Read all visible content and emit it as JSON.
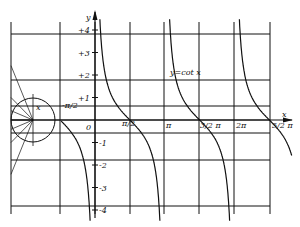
{
  "chart_data": {
    "type": "line",
    "title": "y=cot x",
    "xlabel": "x",
    "ylabel": "y",
    "function": "cot(x)",
    "x_ticks": [
      {
        "label": "-π/2",
        "value": -1.5708
      },
      {
        "label": "0",
        "value": 0
      },
      {
        "label": "π/2",
        "value": 1.5708
      },
      {
        "label": "π",
        "value": 3.1416
      },
      {
        "label": "3/2 π",
        "value": 4.7124
      },
      {
        "label": "2π",
        "value": 6.2832
      },
      {
        "label": "5/2 π",
        "value": 7.854
      }
    ],
    "y_ticks": [
      {
        "label": "+4",
        "value": 4
      },
      {
        "label": "+3",
        "value": 3
      },
      {
        "label": "+2",
        "value": 2
      },
      {
        "label": "+1",
        "value": 1
      },
      {
        "label": "-1",
        "value": -1
      },
      {
        "label": "-2",
        "value": -2
      },
      {
        "label": "-3",
        "value": -3
      },
      {
        "label": "-4",
        "value": -4
      }
    ],
    "ylim": [
      -4,
      4
    ],
    "xlim": [
      -2.6,
      8.2
    ],
    "asymptotes": [
      "-π",
      "0",
      "π",
      "2π"
    ],
    "zeros": [
      "-π/2",
      "π/2",
      "3/2 π",
      "5/2 π"
    ],
    "grid": true,
    "annotations": [
      "unit circle construction at left",
      "x (angle mark on circle)"
    ]
  },
  "layout": {
    "origin_px": [
      95,
      120
    ],
    "px_per_x_unit": 22.2,
    "px_per_y_unit": 22.5,
    "grid_v_px": [
      11,
      60,
      95,
      130,
      164,
      199,
      234,
      270
    ],
    "grid_h_px": [
      34,
      80,
      106,
      120,
      133,
      160,
      206
    ],
    "grid_top": 22,
    "grid_bottom": 214,
    "grid_left": 11,
    "grid_right": 270,
    "circle": {
      "cx": 33,
      "cy": 120,
      "r": 22
    },
    "color_ink": "#111111"
  }
}
